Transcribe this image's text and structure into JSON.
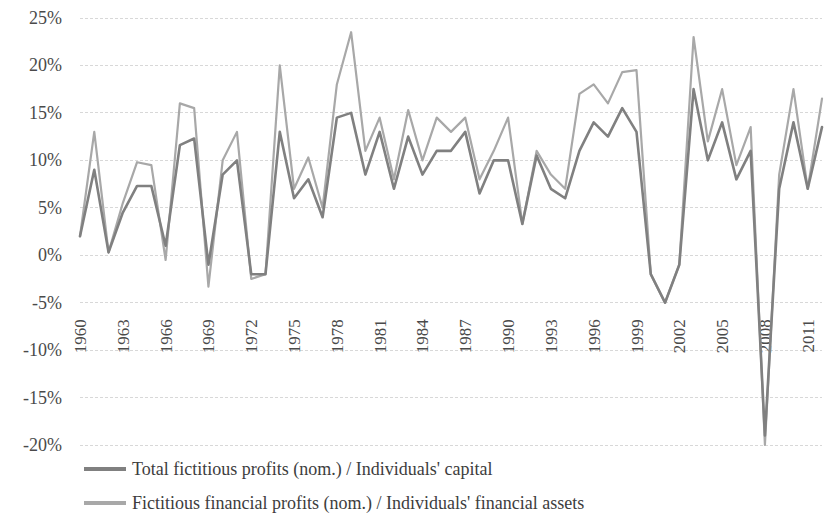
{
  "chart_data": {
    "type": "line",
    "title": "",
    "subtitle": "",
    "xlabel": "",
    "ylabel": "",
    "grid": true,
    "legend_position": "bottom-left",
    "ylim": [
      -20,
      25
    ],
    "ytick_step": 5,
    "ytick_labels": [
      "25%",
      "20%",
      "15%",
      "10%",
      "5%",
      "0%",
      "-5%",
      "-10%",
      "-15%",
      "-20%"
    ],
    "ytick_values": [
      25,
      20,
      15,
      10,
      5,
      0,
      -5,
      -10,
      -15,
      -20
    ],
    "x": [
      1960,
      1961,
      1962,
      1963,
      1964,
      1965,
      1966,
      1967,
      1968,
      1969,
      1970,
      1971,
      1972,
      1973,
      1974,
      1975,
      1976,
      1977,
      1978,
      1979,
      1980,
      1981,
      1982,
      1983,
      1984,
      1985,
      1986,
      1987,
      1988,
      1989,
      1990,
      1991,
      1992,
      1993,
      1994,
      1995,
      1996,
      1997,
      1998,
      1999,
      2000,
      2001,
      2002,
      2003,
      2004,
      2005,
      2006,
      2007,
      2008,
      2009,
      2010,
      2011,
      2012
    ],
    "xtick_labels": [
      "1960",
      "1963",
      "1966",
      "1969",
      "1972",
      "1975",
      "1978",
      "1981",
      "1984",
      "1987",
      "1990",
      "1993",
      "1996",
      "1999",
      "2002",
      "2005",
      "2008",
      "2011"
    ],
    "xtick_values": [
      1960,
      1963,
      1966,
      1969,
      1972,
      1975,
      1978,
      1981,
      1984,
      1987,
      1990,
      1993,
      1996,
      1999,
      2002,
      2005,
      2008,
      2011
    ],
    "series": [
      {
        "name": "Total fictitious profits (nom.) / Individuals' capital",
        "color": "#808080",
        "values": [
          2.0,
          9.0,
          0.3,
          4.5,
          7.3,
          7.3,
          1.0,
          11.6,
          12.3,
          -1.0,
          8.5,
          10.0,
          -2.0,
          -2.0,
          13.0,
          6.0,
          8.0,
          4.0,
          14.5,
          15.0,
          8.5,
          13.0,
          7.0,
          12.5,
          8.5,
          11.0,
          11.0,
          13.0,
          6.5,
          10.0,
          10.0,
          3.3,
          10.5,
          7.0,
          6.0,
          11.0,
          14.0,
          12.5,
          15.5,
          13.0,
          -2.0,
          -5.0,
          -1.0,
          17.5,
          10.0,
          14.0,
          8.0,
          11.0,
          -19.0,
          7.0,
          14.0,
          7.0,
          13.5
        ]
      },
      {
        "name": "Fictitious financial profits (nom.) / Individuals' financial assets",
        "color": "#a8a8a8",
        "values": [
          2.0,
          13.0,
          0.3,
          5.5,
          9.8,
          9.5,
          -0.5,
          16.0,
          15.5,
          -3.3,
          10.0,
          13.0,
          -2.5,
          -2.0,
          20.0,
          7.0,
          10.3,
          5.0,
          18.0,
          23.5,
          11.0,
          14.5,
          8.0,
          15.3,
          10.0,
          14.5,
          13.0,
          14.5,
          8.0,
          11.0,
          14.5,
          3.3,
          11.0,
          8.5,
          7.0,
          17.0,
          18.0,
          16.0,
          19.3,
          19.5,
          -2.0,
          -5.0,
          -1.0,
          23.0,
          12.0,
          17.5,
          9.5,
          13.5,
          -20.0,
          8.5,
          17.5,
          7.0,
          16.5
        ]
      }
    ]
  },
  "legend": {
    "items": [
      {
        "label": "Total fictitious profits (nom.) / Individuals' capital",
        "color": "#808080"
      },
      {
        "label": "Fictitious financial profits (nom.) / Individuals' financial assets",
        "color": "#a8a8a8"
      }
    ]
  }
}
